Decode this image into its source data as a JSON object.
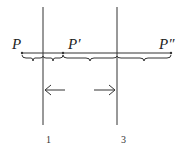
{
  "diagram": {
    "points": [
      {
        "id": "p",
        "label": "P"
      },
      {
        "id": "p-prime",
        "label": "P′"
      },
      {
        "id": "p-double-prime",
        "label": "P″"
      }
    ],
    "mirrors": [
      {
        "id": "mirror-1",
        "label": "1"
      },
      {
        "id": "mirror-3",
        "label": "3"
      }
    ],
    "arrows": [
      {
        "id": "arrow-left",
        "direction": "left"
      },
      {
        "id": "arrow-right",
        "direction": "right"
      }
    ],
    "colors": {
      "ink": "#333333",
      "background": "#ffffff"
    }
  }
}
